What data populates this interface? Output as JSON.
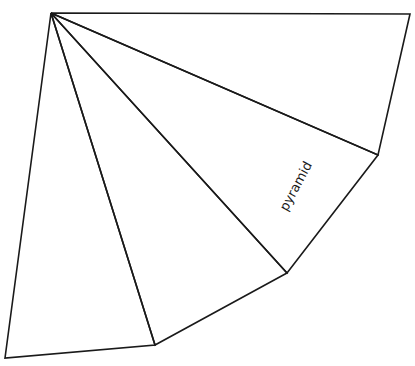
{
  "diagram": {
    "type": "pyramid-net",
    "label": "pyramid",
    "stroke_color": "#1a1a1a",
    "background": "#ffffff",
    "apex": [
      51,
      13
    ],
    "base_vertices": [
      [
        410,
        14
      ],
      [
        378,
        155
      ],
      [
        287,
        273
      ],
      [
        155,
        345
      ],
      [
        5,
        358
      ]
    ],
    "faces": [
      {
        "name": "face-1",
        "points": [
          [
            51,
            13
          ],
          [
            410,
            14
          ],
          [
            378,
            155
          ]
        ]
      },
      {
        "name": "face-2",
        "points": [
          [
            51,
            13
          ],
          [
            378,
            155
          ],
          [
            287,
            273
          ]
        ]
      },
      {
        "name": "face-3",
        "points": [
          [
            51,
            13
          ],
          [
            287,
            273
          ],
          [
            155,
            345
          ]
        ]
      },
      {
        "name": "face-4",
        "points": [
          [
            51,
            13
          ],
          [
            155,
            345
          ],
          [
            5,
            358
          ]
        ]
      }
    ]
  }
}
